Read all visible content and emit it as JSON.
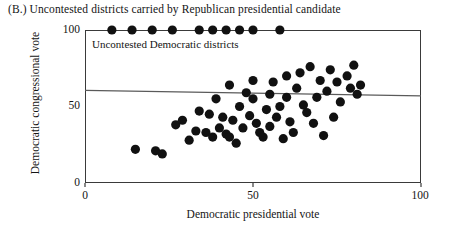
{
  "figure": {
    "panel_label": "(B.)",
    "panel_title": "(B.) Uncontested districts carried by Republican presidential candidate",
    "inplot_note": "Uncontested Democratic districts",
    "axis_color": "#3a3a3a",
    "point_color": "#111111",
    "line_color": "#5a5a5a"
  },
  "chart_data": {
    "type": "scatter",
    "title": "(B.) Uncontested districts carried by Republican presidential candidate",
    "xlabel": "Democratic presidential vote",
    "ylabel": "Democratic congressional vote",
    "xlim": [
      0,
      100
    ],
    "ylim": [
      0,
      100
    ],
    "xticks": [
      0,
      50,
      100
    ],
    "yticks": [
      0,
      50,
      100
    ],
    "xtick_labels": [
      "0",
      "50",
      "100"
    ],
    "ytick_labels": [
      "0",
      "50",
      "100"
    ],
    "grid": false,
    "legend": null,
    "annotations": [
      {
        "text": "Uncontested Democratic districts",
        "x": 4,
        "y": 94,
        "note": "label for the row of points pinned at 100 on the congressional-vote axis"
      }
    ],
    "series": [
      {
        "name": "Uncontested Democratic districts (congressional vote = 100)",
        "marker": "filled-circle",
        "marker_size": 4.6,
        "points": [
          {
            "x": 8,
            "y": 100
          },
          {
            "x": 14,
            "y": 100
          },
          {
            "x": 20,
            "y": 100
          },
          {
            "x": 26,
            "y": 100
          },
          {
            "x": 34,
            "y": 100
          },
          {
            "x": 38,
            "y": 100
          },
          {
            "x": 42,
            "y": 100
          },
          {
            "x": 46,
            "y": 100
          },
          {
            "x": 50,
            "y": 100
          },
          {
            "x": 58,
            "y": 100
          }
        ]
      },
      {
        "name": "Contested districts",
        "marker": "filled-circle",
        "marker_size": 4.6,
        "points": [
          {
            "x": 15,
            "y": 22
          },
          {
            "x": 21,
            "y": 21
          },
          {
            "x": 23,
            "y": 19
          },
          {
            "x": 27,
            "y": 38
          },
          {
            "x": 29,
            "y": 41
          },
          {
            "x": 31,
            "y": 28
          },
          {
            "x": 33,
            "y": 34
          },
          {
            "x": 34,
            "y": 47
          },
          {
            "x": 36,
            "y": 33
          },
          {
            "x": 37,
            "y": 45
          },
          {
            "x": 38,
            "y": 30
          },
          {
            "x": 39,
            "y": 55
          },
          {
            "x": 40,
            "y": 36
          },
          {
            "x": 41,
            "y": 43
          },
          {
            "x": 42,
            "y": 32
          },
          {
            "x": 43,
            "y": 30
          },
          {
            "x": 43,
            "y": 64
          },
          {
            "x": 44,
            "y": 41
          },
          {
            "x": 45,
            "y": 26
          },
          {
            "x": 46,
            "y": 50
          },
          {
            "x": 47,
            "y": 36
          },
          {
            "x": 48,
            "y": 59
          },
          {
            "x": 49,
            "y": 44
          },
          {
            "x": 50,
            "y": 67
          },
          {
            "x": 50,
            "y": 55
          },
          {
            "x": 51,
            "y": 39
          },
          {
            "x": 52,
            "y": 33
          },
          {
            "x": 53,
            "y": 30
          },
          {
            "x": 54,
            "y": 48
          },
          {
            "x": 55,
            "y": 58
          },
          {
            "x": 55,
            "y": 37
          },
          {
            "x": 56,
            "y": 66
          },
          {
            "x": 57,
            "y": 43
          },
          {
            "x": 58,
            "y": 50
          },
          {
            "x": 59,
            "y": 29
          },
          {
            "x": 60,
            "y": 56
          },
          {
            "x": 60,
            "y": 70
          },
          {
            "x": 61,
            "y": 40
          },
          {
            "x": 62,
            "y": 33
          },
          {
            "x": 63,
            "y": 62
          },
          {
            "x": 64,
            "y": 72
          },
          {
            "x": 65,
            "y": 51
          },
          {
            "x": 66,
            "y": 46
          },
          {
            "x": 67,
            "y": 76
          },
          {
            "x": 68,
            "y": 39
          },
          {
            "x": 69,
            "y": 56
          },
          {
            "x": 70,
            "y": 67
          },
          {
            "x": 71,
            "y": 31
          },
          {
            "x": 72,
            "y": 60
          },
          {
            "x": 73,
            "y": 74
          },
          {
            "x": 74,
            "y": 43
          },
          {
            "x": 75,
            "y": 66
          },
          {
            "x": 76,
            "y": 53
          },
          {
            "x": 78,
            "y": 70
          },
          {
            "x": 79,
            "y": 62
          },
          {
            "x": 80,
            "y": 77
          },
          {
            "x": 81,
            "y": 58
          },
          {
            "x": 82,
            "y": 64
          }
        ]
      }
    ],
    "fit_line": {
      "name": "regression line",
      "x0": 0,
      "y0": 60.5,
      "x1": 100,
      "y1": 57.0,
      "slope": -0.035,
      "intercept": 60.5
    }
  }
}
